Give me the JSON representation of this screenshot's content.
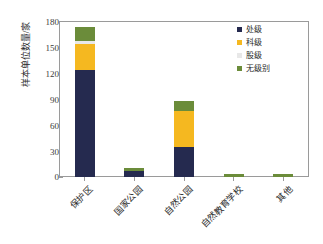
{
  "chart_data": {
    "type": "bar",
    "subtype": "stacked-vertical",
    "title": "",
    "xlabel": "",
    "ylabel": "样本单位数量/家",
    "ylim": [
      0,
      180
    ],
    "yticks": [
      0,
      30,
      60,
      90,
      120,
      150,
      180
    ],
    "grid": false,
    "legend_position": "top-right",
    "categories": [
      "保护区",
      "国家公园",
      "自然公园",
      "自然教育学校",
      "其他"
    ],
    "series": [
      {
        "name": "处级",
        "color": "#252A4F",
        "values": [
          124,
          7,
          35,
          0,
          0
        ]
      },
      {
        "name": "科级",
        "color": "#F5B820",
        "values": [
          31,
          0,
          42,
          0,
          0
        ]
      },
      {
        "name": "股级",
        "color": "#E8E8E8",
        "values": [
          3,
          0,
          0,
          0,
          0
        ]
      },
      {
        "name": "无级别",
        "color": "#6B8C3A",
        "values": [
          16,
          3,
          11,
          3,
          3
        ]
      }
    ],
    "totals": [
      174,
      10,
      88,
      3,
      3
    ]
  },
  "axis": {
    "y_title": "样本单位数量/家",
    "y_tick_labels": [
      "180",
      "150",
      "120",
      "90",
      "60",
      "30",
      "0"
    ]
  },
  "legend": {
    "items": [
      {
        "label": "处级",
        "color": "#252A4F"
      },
      {
        "label": "科级",
        "color": "#F5B820"
      },
      {
        "label": "股级",
        "color": "#E8E8E8"
      },
      {
        "label": "无级别",
        "color": "#6B8C3A"
      }
    ]
  },
  "colors": {
    "series_1": "#252A4F",
    "series_2": "#F5B820",
    "series_3": "#E8E8E8",
    "series_4": "#6B8C3A",
    "axis": "#9a9a9a",
    "text": "#2b2b2b",
    "background": "#ffffff"
  }
}
